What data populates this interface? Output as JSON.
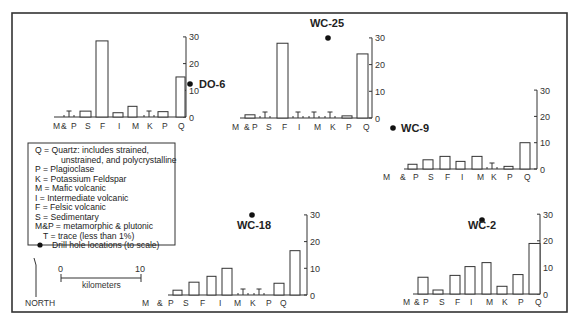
{
  "axis_ticks": [
    "0",
    "10",
    "20",
    "30"
  ],
  "trace_symbol": "T",
  "legend": {
    "items": [
      "Q = Quartz: includes strained,",
      "unstrained, and polycrystalline",
      "P = Plagioclase",
      "K = Potassium Feldspar",
      "M = Mafic volcanic",
      "I = Intermediate volcanic",
      "F = Felsic volcanic",
      "S = Sedimentary",
      "M&P = metamorphic & plutonic",
      "T = trace (less than 1%)",
      "Drill hole locations (to scale)"
    ]
  },
  "scale_bar": {
    "start": "0",
    "end": "10",
    "unit": "kilometers"
  },
  "north_label": "NORTH",
  "chart_data": [
    {
      "type": "bar",
      "title": "DO-6",
      "categories": [
        "M&P",
        "S",
        "F",
        "I",
        "M",
        "K",
        "P",
        "Q"
      ],
      "values": [
        0,
        2.2,
        28.5,
        1.6,
        4,
        0,
        2,
        15
      ],
      "trace": [
        true,
        false,
        false,
        false,
        false,
        true,
        false,
        false
      ],
      "ylim": [
        0,
        30
      ],
      "yticks": [
        0,
        10,
        20,
        30
      ],
      "xlabel": "",
      "ylabel": ""
    },
    {
      "type": "bar",
      "title": "WC-25",
      "categories": [
        "M&P",
        "S",
        "F",
        "I",
        "M",
        "K",
        "P",
        "Q"
      ],
      "values": [
        1.2,
        0,
        28,
        0,
        0,
        0,
        0.8,
        24
      ],
      "trace": [
        false,
        true,
        false,
        true,
        true,
        true,
        false,
        false
      ],
      "ylim": [
        0,
        30
      ],
      "yticks": [
        0,
        10,
        20,
        30
      ],
      "xlabel": "",
      "ylabel": ""
    },
    {
      "type": "bar",
      "title": "WC-9",
      "categories": [
        "M&P",
        "S",
        "F",
        "I",
        "M",
        "K",
        "P",
        "Q"
      ],
      "values": [
        1.8,
        3.5,
        4.8,
        2.9,
        4.8,
        0,
        1,
        10
      ],
      "trace": [
        false,
        false,
        false,
        false,
        false,
        true,
        false,
        false
      ],
      "ylim": [
        0,
        30
      ],
      "yticks": [
        0,
        10,
        20,
        30
      ],
      "xlabel": "",
      "ylabel": ""
    },
    {
      "type": "bar",
      "title": "WC-18",
      "categories": [
        "M&P",
        "S",
        "F",
        "I",
        "M",
        "K",
        "P",
        "Q"
      ],
      "values": [
        1.8,
        4.8,
        7,
        10,
        0,
        0,
        4.4,
        16.6
      ],
      "trace": [
        false,
        false,
        false,
        false,
        true,
        true,
        false,
        false
      ],
      "ylim": [
        0,
        30
      ],
      "yticks": [
        0,
        10,
        20,
        30
      ],
      "xlabel": "",
      "ylabel": ""
    },
    {
      "type": "bar",
      "title": "WC-2",
      "categories": [
        "M&P",
        "S",
        "F",
        "I",
        "M",
        "K",
        "P",
        "Q"
      ],
      "values": [
        6.3,
        1.5,
        7,
        10.3,
        11.8,
        2.9,
        7.3,
        19
      ],
      "trace": [
        false,
        false,
        false,
        false,
        false,
        false,
        false,
        false
      ],
      "ylim": [
        0,
        30
      ],
      "yticks": [
        0,
        10,
        20,
        30
      ],
      "xlabel": "",
      "ylabel": ""
    }
  ]
}
